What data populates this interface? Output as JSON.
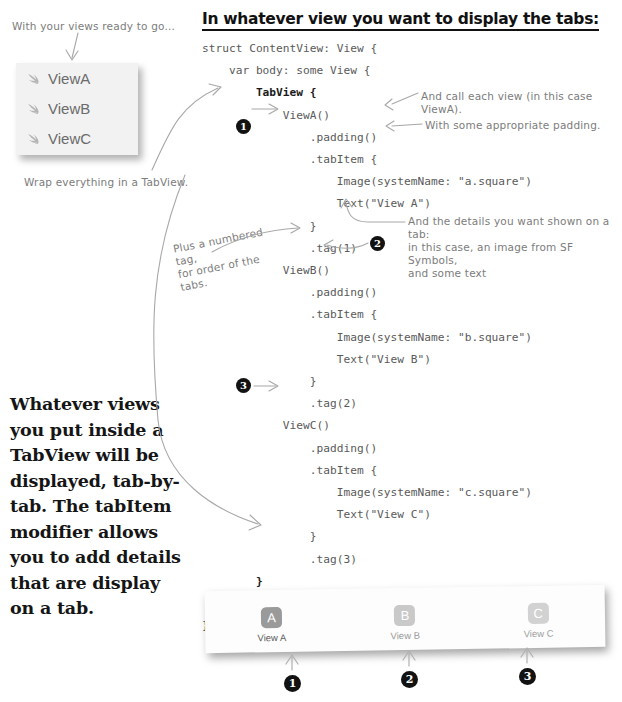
{
  "heading": "In whatever view you want to display the tabs:",
  "annotations": {
    "views_ready": "With your views ready to go...",
    "wrap_everything": "Wrap everything in a TabView.",
    "call_each_view": "And call each view (in this case ViewA).",
    "appropriate_padding": "With some appropriate padding.",
    "details_shown": "And the details you want shown on a tab:\nin this case, an image from SF Symbols,\nand some text",
    "numbered_tag": "Plus a numbered tag,\nfor order of the tabs."
  },
  "body_text": "Whatever views you put inside a TabView will be displayed, tab-by-tab. The tabItem modifier allows you to add details that are display on a tab.",
  "file_list": {
    "items": [
      {
        "icon": "swift-bird-icon",
        "label": "ViewA"
      },
      {
        "icon": "swift-bird-icon",
        "label": "ViewB"
      },
      {
        "icon": "swift-bird-icon",
        "label": "ViewC"
      }
    ]
  },
  "code": {
    "lines": [
      {
        "text": "struct ContentView: View {",
        "indent": 0,
        "style": "normal"
      },
      {
        "text": "var body: some View {",
        "indent": 1,
        "style": "normal"
      },
      {
        "text": "TabView {",
        "indent": 2,
        "style": "bold"
      },
      {
        "text": "ViewA()",
        "indent": 3,
        "style": "normal"
      },
      {
        "text": ".padding()",
        "indent": 4,
        "style": "normal"
      },
      {
        "text": ".tabItem {",
        "indent": 4,
        "style": "normal"
      },
      {
        "text": "Image(systemName: \"a.square\")",
        "indent": 5,
        "style": "normal"
      },
      {
        "text": "Text(\"View A\")",
        "indent": 5,
        "style": "normal"
      },
      {
        "text": "}",
        "indent": 4,
        "style": "normal"
      },
      {
        "text": ".tag(1)",
        "indent": 4,
        "style": "normal"
      },
      {
        "text": "ViewB()",
        "indent": 3,
        "style": "normal"
      },
      {
        "text": ".padding()",
        "indent": 4,
        "style": "normal"
      },
      {
        "text": ".tabItem {",
        "indent": 4,
        "style": "normal"
      },
      {
        "text": "Image(systemName: \"b.square\")",
        "indent": 5,
        "style": "normal"
      },
      {
        "text": "Text(\"View B\")",
        "indent": 5,
        "style": "normal"
      },
      {
        "text": "}",
        "indent": 4,
        "style": "normal"
      },
      {
        "text": ".tag(2)",
        "indent": 4,
        "style": "normal"
      },
      {
        "text": "ViewC()",
        "indent": 3,
        "style": "normal"
      },
      {
        "text": ".padding()",
        "indent": 4,
        "style": "normal"
      },
      {
        "text": ".tabItem {",
        "indent": 4,
        "style": "normal"
      },
      {
        "text": "Image(systemName: \"c.square\")",
        "indent": 5,
        "style": "normal"
      },
      {
        "text": "Text(\"View C\")",
        "indent": 5,
        "style": "normal"
      },
      {
        "text": "}",
        "indent": 4,
        "style": "normal"
      },
      {
        "text": ".tag(3)",
        "indent": 4,
        "style": "normal"
      },
      {
        "text": "}",
        "indent": 2,
        "style": "bold"
      },
      {
        "text": "}",
        "indent": 1,
        "style": "normal"
      },
      {
        "text": "}",
        "indent": 0,
        "style": "normal"
      }
    ]
  },
  "callouts": {
    "code_markers": [
      "1",
      "2",
      "3"
    ],
    "tab_markers": [
      "1",
      "2",
      "3"
    ]
  },
  "tabbar": {
    "tabs": [
      {
        "glyph": "A",
        "label": "View A",
        "glyph_bg": "#9a9a9a",
        "label_color": "#5e5e5e",
        "selected": true
      },
      {
        "glyph": "B",
        "label": "View B",
        "glyph_bg": "#c9c9c9",
        "label_color": "#9a9a9a",
        "selected": false
      },
      {
        "glyph": "C",
        "label": "View C",
        "glyph_bg": "#d2d2d2",
        "label_color": "#a2a2a2",
        "selected": false
      }
    ]
  },
  "colors": {
    "ink": "#7c7c7c",
    "code": "#5a5a5a",
    "heading": "#111111",
    "bullet_bg": "#121212",
    "card_bg": "#f2f2f2"
  }
}
